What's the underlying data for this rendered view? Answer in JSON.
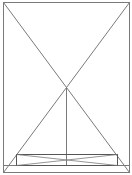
{
  "diagram": {
    "width": 132,
    "height": 175,
    "background": "#ffffff",
    "stroke_color": "#7a7a7a",
    "inner_stroke_color": "#555555",
    "outer_frame": {
      "x1": 3,
      "y1": 2,
      "x2": 129,
      "y2": 172
    },
    "diagonals": [
      {
        "x1": 3,
        "y1": 2,
        "x2": 129,
        "y2": 172
      },
      {
        "x1": 129,
        "y1": 2,
        "x2": 3,
        "y2": 172
      }
    ],
    "vertical_line": {
      "x1": 66,
      "y1": 87,
      "x2": 66,
      "y2": 165
    },
    "baseline": {
      "x1": 3,
      "y1": 165,
      "x2": 129,
      "y2": 165
    },
    "inner_box": {
      "x1": 16,
      "y1": 154,
      "x2": 117,
      "y2": 165
    },
    "inner_box_cross": [
      {
        "x1": 16,
        "y1": 154,
        "x2": 117,
        "y2": 165
      },
      {
        "x1": 117,
        "y1": 154,
        "x2": 16,
        "y2": 165
      }
    ]
  }
}
